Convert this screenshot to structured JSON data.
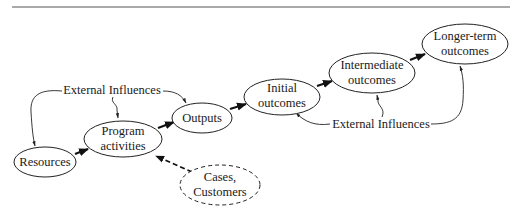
{
  "diagram": {
    "type": "logic-model-flow",
    "nodes": [
      {
        "id": "resources",
        "lines": [
          "Resources"
        ],
        "style": "solid"
      },
      {
        "id": "program-activities",
        "lines": [
          "Program",
          "activities"
        ],
        "style": "solid"
      },
      {
        "id": "outputs",
        "lines": [
          "Outputs"
        ],
        "style": "solid"
      },
      {
        "id": "initial-outcomes",
        "lines": [
          "Initial",
          "outcomes"
        ],
        "style": "solid"
      },
      {
        "id": "intermediate-outcomes",
        "lines": [
          "Intermediate",
          "outcomes"
        ],
        "style": "solid"
      },
      {
        "id": "longer-term-outcomes",
        "lines": [
          "Longer-term",
          "outcomes"
        ],
        "style": "solid"
      },
      {
        "id": "cases-customers",
        "lines": [
          "Cases,",
          "Customers"
        ],
        "style": "dashed"
      }
    ],
    "influences": [
      {
        "id": "external-influences-left",
        "label": "External Influences",
        "targets": [
          "resources",
          "program-activities",
          "outputs"
        ]
      },
      {
        "id": "external-influences-right",
        "label": "External Influences",
        "targets": [
          "initial-outcomes",
          "intermediate-outcomes",
          "longer-term-outcomes"
        ]
      }
    ],
    "edges": [
      {
        "from": "resources",
        "to": "program-activities",
        "style": "solid"
      },
      {
        "from": "program-activities",
        "to": "outputs",
        "style": "solid"
      },
      {
        "from": "outputs",
        "to": "initial-outcomes",
        "style": "solid"
      },
      {
        "from": "initial-outcomes",
        "to": "intermediate-outcomes",
        "style": "solid"
      },
      {
        "from": "intermediate-outcomes",
        "to": "longer-term-outcomes",
        "style": "solid"
      },
      {
        "from": "cases-customers",
        "to": "program-activities",
        "style": "dashed"
      }
    ]
  }
}
